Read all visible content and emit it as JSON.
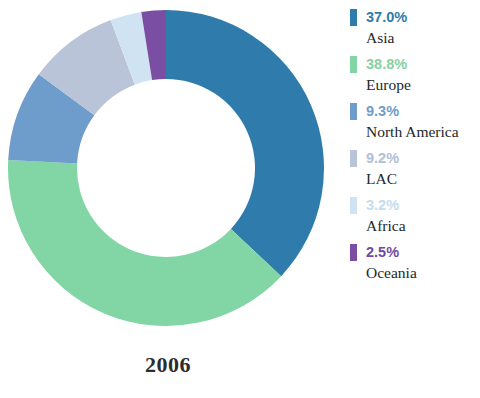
{
  "chart_data": {
    "type": "pie",
    "variant": "donut",
    "title": "2006",
    "xlabel": "",
    "ylabel": "",
    "legend_position": "right",
    "grid": false,
    "start_angle_deg": 0,
    "direction": "clockwise",
    "inner_radius_ratio": 0.56,
    "categories": [
      "Asia",
      "Europe",
      "North America",
      "LAC",
      "Africa",
      "Oceania"
    ],
    "values": [
      37.0,
      38.8,
      9.3,
      9.2,
      3.2,
      2.5
    ],
    "labels": [
      "37.0%",
      "38.8%",
      "9.3%",
      "9.2%",
      "3.2%",
      "2.5%"
    ],
    "colors": [
      "#2f7cac",
      "#82d5a4",
      "#6e9ccb",
      "#b9c4d8",
      "#cfe3f2",
      "#7a4fa3"
    ],
    "slices": [
      {
        "name": "Asia",
        "label": "Asia",
        "value": 37.0,
        "pct_label": "37.0%",
        "color": "#2f7cac",
        "text_color": "#2f7cac"
      },
      {
        "name": "Europe",
        "label": "Europe",
        "value": 38.8,
        "pct_label": "38.8%",
        "color": "#82d5a4",
        "text_color": "#86d1a2"
      },
      {
        "name": "North America",
        "label": "North America",
        "value": 9.3,
        "pct_label": "9.3%",
        "color": "#6e9ccb",
        "text_color": "#6e9ccb"
      },
      {
        "name": "LAC",
        "label": "LAC",
        "value": 9.2,
        "pct_label": "9.2%",
        "color": "#b9c4d8",
        "text_color": "#b0bed6"
      },
      {
        "name": "Africa",
        "label": "Africa",
        "value": 3.2,
        "pct_label": "3.2%",
        "color": "#cfe3f2",
        "text_color": "#c3dcf0"
      },
      {
        "name": "Oceania",
        "label": "Oceania",
        "value": 2.5,
        "pct_label": "2.5%",
        "color": "#7a4fa3",
        "text_color": "#6f49a3"
      }
    ]
  },
  "chart": {
    "year": "2006",
    "center_x": 166,
    "center_y": 168,
    "outer_radius": 158,
    "inner_radius": 89,
    "hole_color": "#ffffff"
  },
  "legend": {
    "items": [
      {
        "pct": "37.0%",
        "name": "Asia"
      },
      {
        "pct": "38.8%",
        "name": "Europe"
      },
      {
        "pct": "9.3%",
        "name": "North America"
      },
      {
        "pct": "9.2%",
        "name": "LAC"
      },
      {
        "pct": "3.2%",
        "name": "Africa"
      },
      {
        "pct": "2.5%",
        "name": "Oceania"
      }
    ]
  }
}
